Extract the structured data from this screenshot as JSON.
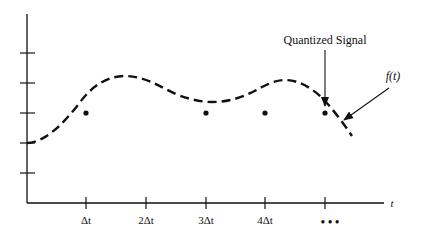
{
  "diagram": {
    "annotations": {
      "quantized_signal": "Quantized Signal",
      "function_label": "f(t)"
    },
    "x_axis": {
      "label": "t",
      "ticks": [
        "Δt",
        "2Δt",
        "3Δt",
        "4Δt",
        ""
      ],
      "continuation": "• • •"
    },
    "y_axis": {
      "tick_count": 5,
      "labels": []
    },
    "samples": {
      "count": 4,
      "level_tick_index": 3
    },
    "colors": {
      "ink": "#111111",
      "background": "#ffffff"
    }
  }
}
